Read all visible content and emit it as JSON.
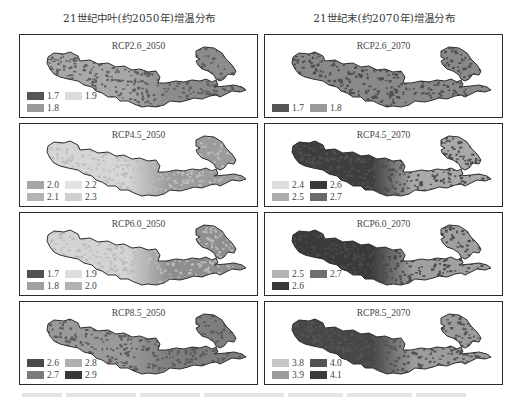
{
  "columns": [
    {
      "title": "21世纪中叶(约2050年)增温分布"
    },
    {
      "title": "21世纪末(约2070年)增温分布"
    }
  ],
  "panels": [
    {
      "title": "RCP2.6_2050",
      "col": 0,
      "row": 0,
      "base_color": "#8c8c8c",
      "speckle_color": "#5e5e5e",
      "west_color": "#a8a8a8",
      "legend": [
        {
          "label": "1.7",
          "color": "#555555"
        },
        {
          "label": "1.9",
          "color": "#dcdcdc"
        },
        {
          "label": "1.8",
          "color": "#9a9a9a"
        }
      ]
    },
    {
      "title": "RCP2.6_2070",
      "col": 1,
      "row": 0,
      "base_color": "#8a8a8a",
      "speckle_color": "#4e4e4e",
      "west_color": "#8a8a8a",
      "legend": [
        {
          "label": "1.7",
          "color": "#555555"
        },
        {
          "label": "1.8",
          "color": "#9a9a9a"
        }
      ]
    },
    {
      "title": "RCP4.5_2050",
      "col": 0,
      "row": 1,
      "base_color": "#9c9c9c",
      "speckle_color": "#bdbdbd",
      "west_color": "#d6d6d6",
      "legend": [
        {
          "label": "2.0",
          "color": "#a6a6a6"
        },
        {
          "label": "2.2",
          "color": "#e2e2e2"
        },
        {
          "label": "2.1",
          "color": "#b4b4b4"
        },
        {
          "label": "2.3",
          "color": "#d0d0d0"
        }
      ]
    },
    {
      "title": "RCP4.5_2070",
      "col": 1,
      "row": 1,
      "base_color": "#a9a9a9",
      "speckle_color": "#505050",
      "west_color": "#3e3e3e",
      "legend": [
        {
          "label": "2.4",
          "color": "#dedede"
        },
        {
          "label": "2.6",
          "color": "#383838"
        },
        {
          "label": "2.5",
          "color": "#acacac"
        },
        {
          "label": "2.7",
          "color": "#6a6a6a"
        }
      ]
    },
    {
      "title": "RCP6.0_2050",
      "col": 0,
      "row": 2,
      "base_color": "#8e8e8e",
      "speckle_color": "#bcbcbc",
      "west_color": "#d4d4d4",
      "legend": [
        {
          "label": "1.7",
          "color": "#505050"
        },
        {
          "label": "1.9",
          "color": "#dedede"
        },
        {
          "label": "1.8",
          "color": "#a0a0a0"
        },
        {
          "label": "2.0",
          "color": "#b2b2b2"
        }
      ]
    },
    {
      "title": "RCP6.0_2070",
      "col": 1,
      "row": 2,
      "base_color": "#a0a0a0",
      "speckle_color": "#4a4a4a",
      "west_color": "#3a3a3a",
      "legend": [
        {
          "label": "2.5",
          "color": "#b4b4b4"
        },
        {
          "label": "2.7",
          "color": "#707070"
        },
        {
          "label": "2.6",
          "color": "#383838"
        }
      ]
    },
    {
      "title": "RCP8.5_2050",
      "col": 0,
      "row": 3,
      "base_color": "#7e7e7e",
      "speckle_color": "#5a5a5a",
      "west_color": "#9a9a9a",
      "legend": [
        {
          "label": "2.6",
          "color": "#4a4a4a"
        },
        {
          "label": "2.8",
          "color": "#b0b0b0"
        },
        {
          "label": "2.7",
          "color": "#7a7a7a"
        },
        {
          "label": "2.9",
          "color": "#383838"
        }
      ]
    },
    {
      "title": "RCP8.5_2070",
      "col": 1,
      "row": 3,
      "base_color": "#9c9c9c",
      "speckle_color": "#555555",
      "west_color": "#474747",
      "legend": [
        {
          "label": "3.8",
          "color": "#c6c6c6"
        },
        {
          "label": "4.0",
          "color": "#525252"
        },
        {
          "label": "3.9",
          "color": "#9a9a9a"
        },
        {
          "label": "4.1",
          "color": "#3a3a3a"
        }
      ]
    }
  ]
}
